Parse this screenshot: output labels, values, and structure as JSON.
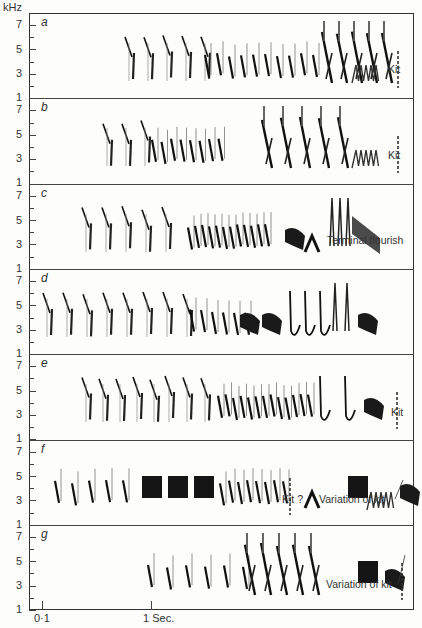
{
  "figure": {
    "y_unit": "kHz",
    "y_ticks": [
      "7",
      "5",
      "3",
      "1"
    ],
    "x_ticks": [
      {
        "label": "0·1",
        "x": 42
      },
      {
        "label": "1 Sec.",
        "x": 151
      }
    ],
    "panels": [
      {
        "id": "a",
        "label": "a",
        "annotations": [
          {
            "text": "Kit",
            "x": 388,
            "y": 73
          }
        ]
      },
      {
        "id": "b",
        "label": "b",
        "annotations": [
          {
            "text": "Kit",
            "x": 388,
            "y": 159
          }
        ]
      },
      {
        "id": "c",
        "label": "c",
        "annotations": [
          {
            "text": "Terminal flourish",
            "x": 327,
            "y": 244
          }
        ]
      },
      {
        "id": "d",
        "label": "d",
        "annotations": []
      },
      {
        "id": "e",
        "label": "e",
        "annotations": [
          {
            "text": "Kit",
            "x": 391,
            "y": 416
          }
        ]
      },
      {
        "id": "f",
        "label": "f",
        "annotations": [
          {
            "text": "Kit ?",
            "x": 282,
            "y": 503
          },
          {
            "text": "Variation of kit",
            "x": 319,
            "y": 503
          }
        ]
      },
      {
        "id": "g",
        "label": "g",
        "annotations": [
          {
            "text": "Variation of kit",
            "x": 326,
            "y": 588
          }
        ]
      }
    ]
  },
  "chart_data": {
    "type": "spectrogram",
    "title": "",
    "ylabel": "kHz",
    "xlabel": "Sec.",
    "ylim": [
      1,
      7.5
    ],
    "y_ticks": [
      1,
      3,
      5,
      7
    ],
    "x_ticks": [
      {
        "label": "0·1",
        "value": 0.1
      },
      {
        "label": "1 Sec.",
        "value": 1
      }
    ],
    "panels": [
      {
        "label": "a",
        "annotations": [
          "Kit"
        ],
        "frequency_range_khz": [
          2,
          7.5
        ]
      },
      {
        "label": "b",
        "annotations": [
          "Kit"
        ],
        "frequency_range_khz": [
          2,
          7
        ]
      },
      {
        "label": "c",
        "annotations": [
          "Terminal flourish"
        ],
        "frequency_range_khz": [
          2,
          7
        ]
      },
      {
        "label": "d",
        "annotations": [],
        "frequency_range_khz": [
          2,
          7.5
        ]
      },
      {
        "label": "e",
        "annotations": [
          "Kit"
        ],
        "frequency_range_khz": [
          2,
          7.5
        ]
      },
      {
        "label": "f",
        "annotations": [
          "Kit ?",
          "Variation of kit"
        ],
        "frequency_range_khz": [
          2.5,
          6
        ]
      },
      {
        "label": "g",
        "annotations": [
          "Variation of kit"
        ],
        "frequency_range_khz": [
          2,
          6
        ]
      }
    ],
    "grid": false,
    "legend": null
  }
}
